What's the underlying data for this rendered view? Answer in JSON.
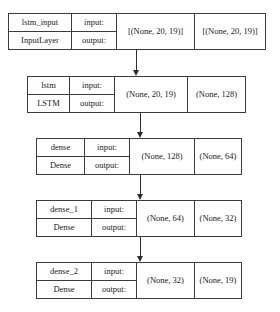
{
  "diagram": {
    "type": "neural-network-layer-stack",
    "io_labels": {
      "input": "input:",
      "output": "output:"
    },
    "colors": {
      "border": "#3b3b3b",
      "arrow": "#2e2e2e",
      "background": "#ffffff"
    },
    "blocks": [
      {
        "name": "lstm_input",
        "class_name": "InputLayer",
        "input_shape": "[(None, 20, 19)]",
        "output_shape": "[(None, 20, 19)]"
      },
      {
        "name": "lstm",
        "class_name": "LSTM",
        "input_shape": "(None, 20, 19)",
        "output_shape": "(None, 128)"
      },
      {
        "name": "dense",
        "class_name": "Dense",
        "input_shape": "(None, 128)",
        "output_shape": "(None, 64)"
      },
      {
        "name": "dense_1",
        "class_name": "Dense",
        "input_shape": "(None, 64)",
        "output_shape": "(None, 32)"
      },
      {
        "name": "dense_2",
        "class_name": "Dense",
        "input_shape": "(None, 32)",
        "output_shape": "(None, 19)"
      }
    ],
    "edges": [
      {
        "from": "lstm_input",
        "to": "lstm"
      },
      {
        "from": "lstm",
        "to": "dense"
      },
      {
        "from": "dense",
        "to": "dense_1"
      },
      {
        "from": "dense_1",
        "to": "dense_2"
      }
    ]
  }
}
